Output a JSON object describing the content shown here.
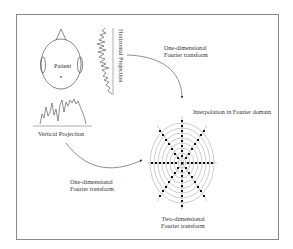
{
  "diagram": {
    "patient_label": "Patient",
    "horizontal_projection_label": "Horizontal Projection",
    "vertical_projection_label": "Vertical Projection",
    "fourier_1d_top": {
      "line1": "One-dimensional",
      "line2": "Fourier transform"
    },
    "fourier_1d_bottom": {
      "line1": "One-dimensional",
      "line2": "Fourier transform"
    },
    "interpolation_label": "Interpolation in Fourier domain",
    "fourier_2d": {
      "line1": "Two-dimensional",
      "line2": "Fourier transform"
    }
  },
  "colors": {
    "line": "#444444",
    "grid": "#9a9a9a",
    "dot": "#111111",
    "frame": "#8a8a8a"
  }
}
